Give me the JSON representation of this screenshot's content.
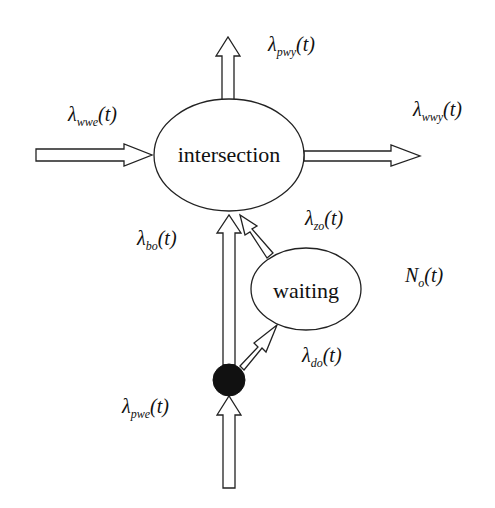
{
  "nodes": {
    "intersection": {
      "label": "intersection"
    },
    "waiting": {
      "label": "waiting"
    }
  },
  "labels": {
    "pwy": {
      "symbol": "λ",
      "sub": "pwy",
      "arg": "(t)"
    },
    "wwe": {
      "symbol": "λ",
      "sub": "wwe",
      "arg": "(t)"
    },
    "wwy": {
      "symbol": "λ",
      "sub": "wwy",
      "arg": "(t)"
    },
    "zo": {
      "symbol": "λ",
      "sub": "zo",
      "arg": "(t)"
    },
    "bo": {
      "symbol": "λ",
      "sub": "bo",
      "arg": "(t)"
    },
    "No": {
      "symbol": "N",
      "sub": "o",
      "arg": "(t)"
    },
    "do": {
      "symbol": "λ",
      "sub": "do",
      "arg": "(t)"
    },
    "pwe": {
      "symbol": "λ",
      "sub": "pwe",
      "arg": "(t)"
    }
  },
  "colors": {
    "stroke": "#222222",
    "fill": "#ffffff",
    "dot": "#111111"
  }
}
